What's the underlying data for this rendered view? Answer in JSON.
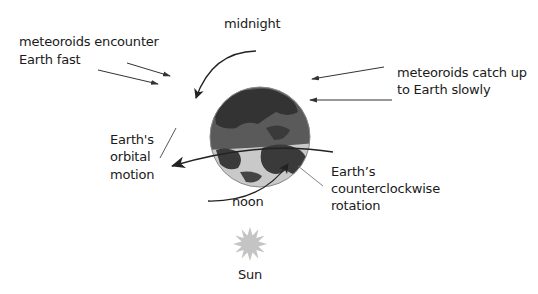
{
  "labels": {
    "midnight": "midnight",
    "noon": "noon",
    "sun": "Sun",
    "fast_line1": "meteoroids encounter",
    "fast_line2": "Earth fast",
    "slow_line1": "meteoroids catch up",
    "slow_line2": "to Earth slowly",
    "orbital_line1": "Earth's",
    "orbital_line2": "orbital",
    "orbital_line3": "motion",
    "rotation_line1": "Earth’s",
    "rotation_line2": "counterclockwise",
    "rotation_line3": "rotation"
  },
  "colors": {
    "night_side": "#4a4a4a",
    "day_side": "#c8c8c8",
    "land_night": "#2e2e2e",
    "land_day": "#3a3a3a",
    "sun": "#c4c4c4",
    "line": "#333333"
  }
}
